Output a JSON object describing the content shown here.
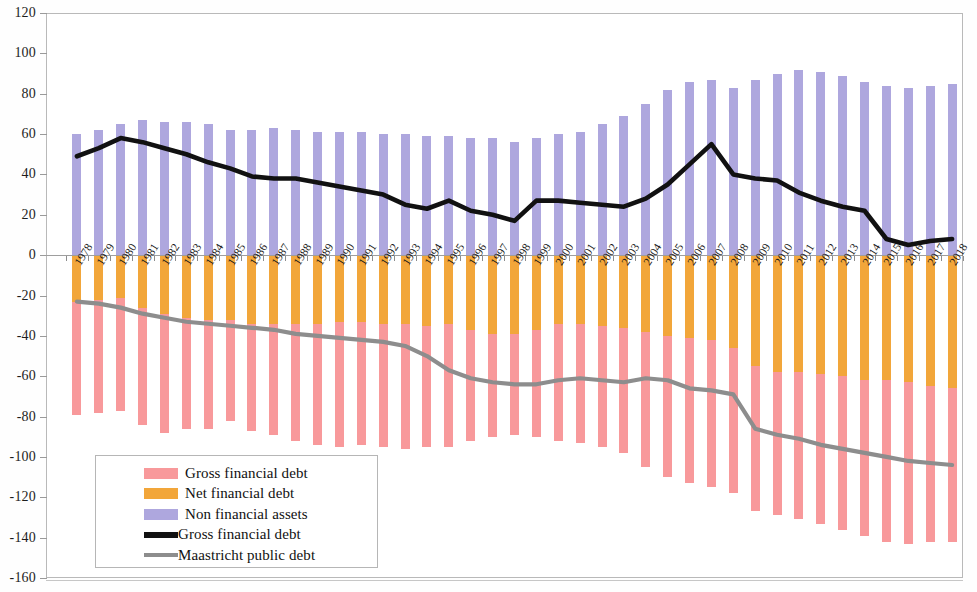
{
  "chart_data": {
    "type": "bar",
    "title": "",
    "subtitle": "",
    "xlabel": "",
    "ylabel": "",
    "ylim": [
      -160,
      120
    ],
    "ytick_step": 20,
    "grid": false,
    "legend_position": "inside-bottom-left",
    "stacked": true,
    "note": "Stacked bars: positive side shows non financial assets; negative side shows net financial debt (orange, nearest zero) then gross financial debt (pink, extending further). Two overlay lines: Gross financial debt (black) and Maastricht public debt (grey).",
    "categories": [
      "1978",
      "1979",
      "1980",
      "1981",
      "1982",
      "1983",
      "1984",
      "1985",
      "1986",
      "1987",
      "1988",
      "1989",
      "1990",
      "1991",
      "1992",
      "1993",
      "1994",
      "1995",
      "1996",
      "1997",
      "1998",
      "1999",
      "2000",
      "2001",
      "2002",
      "2003",
      "2004",
      "2005",
      "2006",
      "2007",
      "2008",
      "2009",
      "2010",
      "2011",
      "2012",
      "2013",
      "2014",
      "2015",
      "2016",
      "2017",
      "2018"
    ],
    "ytick_labels": [
      "120",
      "100",
      "80",
      "60",
      "40",
      "20",
      "0",
      "-20",
      "-40",
      "-60",
      "-80",
      "-100",
      "-120",
      "-140",
      "-160"
    ],
    "series": [
      {
        "name": "Non financial assets",
        "color": "#aea7de",
        "type": "bar",
        "values": [
          60,
          62,
          65,
          67,
          66,
          66,
          65,
          62,
          62,
          63,
          62,
          61,
          61,
          61,
          60,
          60,
          59,
          59,
          58,
          58,
          56,
          58,
          60,
          61,
          65,
          69,
          75,
          82,
          86,
          87,
          83,
          87,
          90,
          92,
          91,
          89,
          86,
          84,
          83,
          84,
          85
        ]
      },
      {
        "name": "Net financial debt",
        "color": "#f2a63a",
        "type": "bar",
        "values": [
          -23,
          -22,
          -21,
          -26,
          -29,
          -31,
          -32,
          -32,
          -34,
          -34,
          -34,
          -34,
          -33,
          -33,
          -34,
          -34,
          -35,
          -34,
          -37,
          -39,
          -39,
          -37,
          -34,
          -34,
          -35,
          -36,
          -38,
          -40,
          -41,
          -42,
          -46,
          -55,
          -58,
          -58,
          -59,
          -60,
          -62,
          -62,
          -63,
          -65,
          -66
        ]
      },
      {
        "name": "Gross financial debt",
        "color": "#f8999b",
        "type": "bar",
        "values": [
          -79,
          -78,
          -77,
          -84,
          -88,
          -86,
          -86,
          -82,
          -87,
          -89,
          -92,
          -94,
          -95,
          -94,
          -95,
          -96,
          -95,
          -95,
          -92,
          -90,
          -89,
          -90,
          -92,
          -93,
          -95,
          -98,
          -105,
          -110,
          -113,
          -115,
          -118,
          -127,
          -129,
          -131,
          -133,
          -136,
          -139,
          -142,
          -143,
          -142,
          -142
        ]
      },
      {
        "name": "Gross financial debt",
        "color": "#111111",
        "type": "line",
        "values": [
          49,
          53,
          58,
          56,
          53,
          50,
          46,
          43,
          39,
          38,
          38,
          36,
          34,
          32,
          30,
          25,
          23,
          27,
          22,
          20,
          17,
          27,
          27,
          26,
          25,
          24,
          28,
          35,
          45,
          55,
          40,
          38,
          37,
          31,
          27,
          24,
          22,
          8,
          5,
          7,
          8
        ]
      },
      {
        "name": "Maastricht public debt",
        "color": "#8d8d8d",
        "type": "line",
        "values": [
          -23,
          -24,
          -26,
          -29,
          -31,
          -33,
          -34,
          -35,
          -36,
          -37,
          -39,
          -40,
          -41,
          -42,
          -43,
          -45,
          -50,
          -57,
          -61,
          -63,
          -64,
          -64,
          -62,
          -61,
          -62,
          -63,
          -61,
          -62,
          -66,
          -67,
          -69,
          -86,
          -89,
          -91,
          -94,
          -96,
          -98,
          -100,
          -102,
          -103,
          -104
        ]
      }
    ]
  },
  "legend": {
    "items": [
      {
        "label": "Gross financial debt",
        "color": "#f8999b",
        "marker": "box"
      },
      {
        "label": "Net financial debt",
        "color": "#f2a63a",
        "marker": "box"
      },
      {
        "label": "Non financial assets",
        "color": "#aea7de",
        "marker": "box"
      },
      {
        "label": "Gross financial debt",
        "color": "#111111",
        "marker": "line"
      },
      {
        "label": "Maastricht public debt",
        "color": "#8d8d8d",
        "marker": "line"
      }
    ]
  }
}
